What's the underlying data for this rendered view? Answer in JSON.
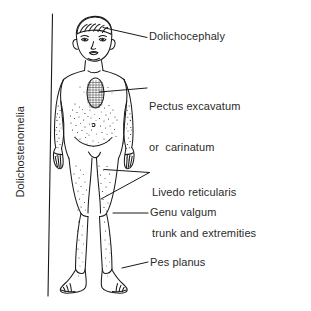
{
  "figure": {
    "type": "medical-line-illustration",
    "background_color": "#ffffff",
    "ink_color": "#1a1a1a"
  },
  "labels": {
    "dolichocephaly": "Dolichocephaly",
    "pectus_line1": "Pectus excavatum",
    "pectus_line2": "or  carinatum",
    "livedo_line1": "Livedo reticularis",
    "livedo_line2": "trunk and extremities",
    "genu_valgum": "Genu valgum",
    "pes_planus": "Pes planus",
    "dolichostenomelia": "Dolichostenomelia"
  },
  "annotations": {
    "leader_color": "#1a1a1a",
    "count": 6
  }
}
